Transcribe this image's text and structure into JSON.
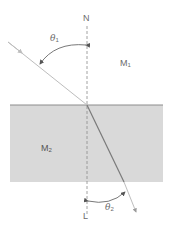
{
  "diagram": {
    "labels": {
      "normal_top": "N",
      "normal_bottom": "L",
      "medium1": "M",
      "medium1_sub": "1",
      "medium2": "M",
      "medium2_sub": "2",
      "theta1": "θ",
      "theta1_sub": "1",
      "theta2": "θ",
      "theta2_sub": "2"
    },
    "colors": {
      "medium2_fill": "#d9d9d9",
      "interface_line": "#8c8c8c",
      "incident_ray": "#bdbdbd",
      "refracted_ray": "#7a7a7a",
      "normal_line": "#8a8a8a",
      "arc": "#555555",
      "text": "#6b6b6b"
    }
  }
}
